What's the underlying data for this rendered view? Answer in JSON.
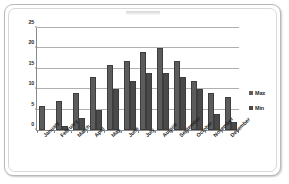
{
  "chart_data": {
    "type": "bar",
    "title": "",
    "xlabel": "",
    "ylabel": "",
    "ylim": [
      0,
      25
    ],
    "yticks": [
      0,
      5,
      10,
      15,
      20,
      25
    ],
    "grid": true,
    "legend_position": "right",
    "categories": [
      "January",
      "February",
      "March",
      "April",
      "May",
      "June",
      "July",
      "August",
      "September",
      "October",
      "November",
      "December"
    ],
    "series": [
      {
        "name": "Max",
        "values": [
          6,
          7,
          9,
          13,
          16,
          17,
          19,
          20,
          17,
          12,
          9,
          8
        ]
      },
      {
        "name": "Min",
        "values": [
          0,
          1,
          3,
          5,
          10,
          12,
          14,
          14,
          13,
          10,
          4,
          2
        ]
      }
    ]
  },
  "colors": {
    "max_bar": "#5c5c5c",
    "min_bar": "#4a4a4a",
    "gridline": "#b0b0b0",
    "axis": "#8a8a8a",
    "frame_border": "#b9b9b9",
    "background": "#ffffff",
    "text": "#1f1f1f"
  }
}
